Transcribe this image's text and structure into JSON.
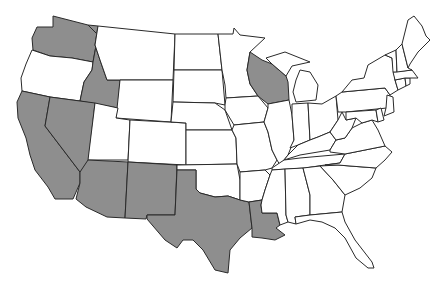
{
  "map": {
    "title": "United States map with highlighted states",
    "colors": {
      "highlighted": "#8e8e8e",
      "default": "#ffffff",
      "border": "#2a2a2a"
    },
    "highlighted_states": [
      "Washington",
      "Idaho",
      "California",
      "Nevada",
      "Arizona",
      "New Mexico",
      "Texas",
      "Louisiana",
      "Wisconsin"
    ],
    "states": [
      {
        "name": "Washington",
        "highlighted": true
      },
      {
        "name": "Oregon",
        "highlighted": false
      },
      {
        "name": "California",
        "highlighted": true
      },
      {
        "name": "Idaho",
        "highlighted": true
      },
      {
        "name": "Nevada",
        "highlighted": true
      },
      {
        "name": "Montana",
        "highlighted": false
      },
      {
        "name": "Wyoming",
        "highlighted": false
      },
      {
        "name": "Utah",
        "highlighted": false
      },
      {
        "name": "Arizona",
        "highlighted": true
      },
      {
        "name": "Colorado",
        "highlighted": false
      },
      {
        "name": "New Mexico",
        "highlighted": true
      },
      {
        "name": "North Dakota",
        "highlighted": false
      },
      {
        "name": "South Dakota",
        "highlighted": false
      },
      {
        "name": "Nebraska",
        "highlighted": false
      },
      {
        "name": "Kansas",
        "highlighted": false
      },
      {
        "name": "Oklahoma",
        "highlighted": false
      },
      {
        "name": "Texas",
        "highlighted": true
      },
      {
        "name": "Minnesota",
        "highlighted": false
      },
      {
        "name": "Iowa",
        "highlighted": false
      },
      {
        "name": "Missouri",
        "highlighted": false
      },
      {
        "name": "Arkansas",
        "highlighted": false
      },
      {
        "name": "Louisiana",
        "highlighted": true
      },
      {
        "name": "Wisconsin",
        "highlighted": true
      },
      {
        "name": "Illinois",
        "highlighted": false
      },
      {
        "name": "Michigan",
        "highlighted": false
      },
      {
        "name": "Indiana",
        "highlighted": false
      },
      {
        "name": "Ohio",
        "highlighted": false
      },
      {
        "name": "Kentucky",
        "highlighted": false
      },
      {
        "name": "Tennessee",
        "highlighted": false
      },
      {
        "name": "Mississippi",
        "highlighted": false
      },
      {
        "name": "Alabama",
        "highlighted": false
      },
      {
        "name": "Georgia",
        "highlighted": false
      },
      {
        "name": "Florida",
        "highlighted": false
      },
      {
        "name": "South Carolina",
        "highlighted": false
      },
      {
        "name": "North Carolina",
        "highlighted": false
      },
      {
        "name": "Virginia",
        "highlighted": false
      },
      {
        "name": "West Virginia",
        "highlighted": false
      },
      {
        "name": "Pennsylvania",
        "highlighted": false
      },
      {
        "name": "New York",
        "highlighted": false
      },
      {
        "name": "Maryland",
        "highlighted": false
      },
      {
        "name": "Delaware",
        "highlighted": false
      },
      {
        "name": "New Jersey",
        "highlighted": false
      },
      {
        "name": "Connecticut",
        "highlighted": false
      },
      {
        "name": "Rhode Island",
        "highlighted": false
      },
      {
        "name": "Massachusetts",
        "highlighted": false
      },
      {
        "name": "Vermont",
        "highlighted": false
      },
      {
        "name": "New Hampshire",
        "highlighted": false
      },
      {
        "name": "Maine",
        "highlighted": false
      }
    ]
  }
}
